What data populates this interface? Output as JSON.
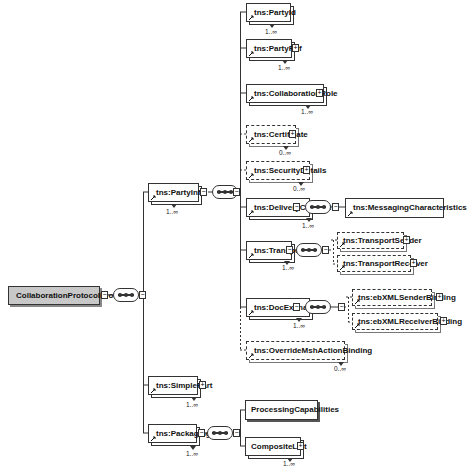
{
  "diagram": {
    "root": {
      "label": "CollaborationProtocolProfile"
    },
    "party_info": {
      "label": "tns:PartyInfo",
      "cardinality": "1..∞"
    },
    "simple_part": {
      "label": "tns:SimplePart",
      "cardinality": "1..∞"
    },
    "packaging": {
      "label": "tns:Packaging",
      "cardinality": "1..∞"
    },
    "party_children": [
      {
        "label": "tns:PartyId",
        "cardinality": "1..∞"
      },
      {
        "label": "tns:PartyRef",
        "cardinality": "1..∞"
      },
      {
        "label": "tns:CollaborationRole",
        "cardinality": "1..∞"
      },
      {
        "label": "tns:Certificate",
        "cardinality": "0..∞"
      },
      {
        "label": "tns:SecurityDetails",
        "cardinality": "0..∞"
      },
      {
        "label": "tns:DeliveryChannel",
        "cardinality": "1..∞"
      },
      {
        "label": "tns:Transport",
        "cardinality": "1..∞"
      },
      {
        "label": "tns:DocExchange",
        "cardinality": "1..∞"
      },
      {
        "label": "tns:OverrideMshActionBinding",
        "cardinality": "0..∞"
      }
    ],
    "delivery_children": [
      {
        "label": "tns:MessagingCharacteristics"
      }
    ],
    "transport_children": [
      {
        "label": "tns:TransportSender"
      },
      {
        "label": "tns:TransportReceiver"
      }
    ],
    "docexchange_children": [
      {
        "label": "tns:ebXMLSenderBinding"
      },
      {
        "label": "tns:ebXMLReceiverBinding"
      }
    ],
    "packaging_children": [
      {
        "label": "ProcessingCapabilities"
      },
      {
        "label": "CompositeList",
        "cardinality": "1..∞"
      }
    ],
    "symbols": {
      "expand": "+",
      "collapse": "−"
    }
  }
}
